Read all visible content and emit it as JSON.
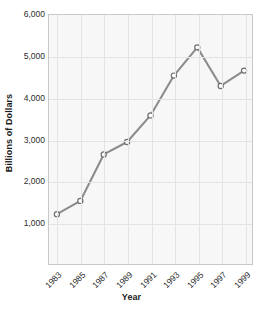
{
  "chart_data": {
    "type": "line",
    "title": "",
    "xlabel": "Year",
    "ylabel": "Billions of Dollars",
    "categories": [
      "1983",
      "1985",
      "1987",
      "1989",
      "1991",
      "1993",
      "1995",
      "1997",
      "1999"
    ],
    "x": [
      1983,
      1985,
      1987,
      1989,
      1991,
      1993,
      1995,
      1997,
      1999
    ],
    "values": [
      1200,
      1520,
      2640,
      2940,
      3580,
      4540,
      5220,
      4290,
      4660
    ],
    "series": [
      {
        "name": "Billions of Dollars",
        "values": [
          1200,
          1520,
          2640,
          2940,
          3580,
          4540,
          5220,
          4290,
          4660
        ]
      }
    ],
    "ylim": [
      0,
      6000
    ],
    "yticks": [
      1000,
      2000,
      3000,
      4000,
      5000,
      6000
    ],
    "ytick_labels": [
      "1,000",
      "2,000",
      "3,000",
      "4,000",
      "5,000",
      "6,000"
    ],
    "xtick_labels": [
      "1983",
      "1985",
      "1987",
      "1989",
      "1991",
      "1993",
      "1995",
      "1997",
      "1999"
    ],
    "xtick_rotation": -45,
    "grid": true,
    "legend": false,
    "legend_position": "none",
    "line_color": "#8c8c8c",
    "marker": "open-circle",
    "marker_face_color": "#ffffff",
    "marker_edge_color": "#6e6e6e",
    "plot_background": "#f7f7f7",
    "grid_color": "#e3e3e3",
    "axis_border_color": "#c8c8c8",
    "text_color": "#2b2b2b"
  }
}
